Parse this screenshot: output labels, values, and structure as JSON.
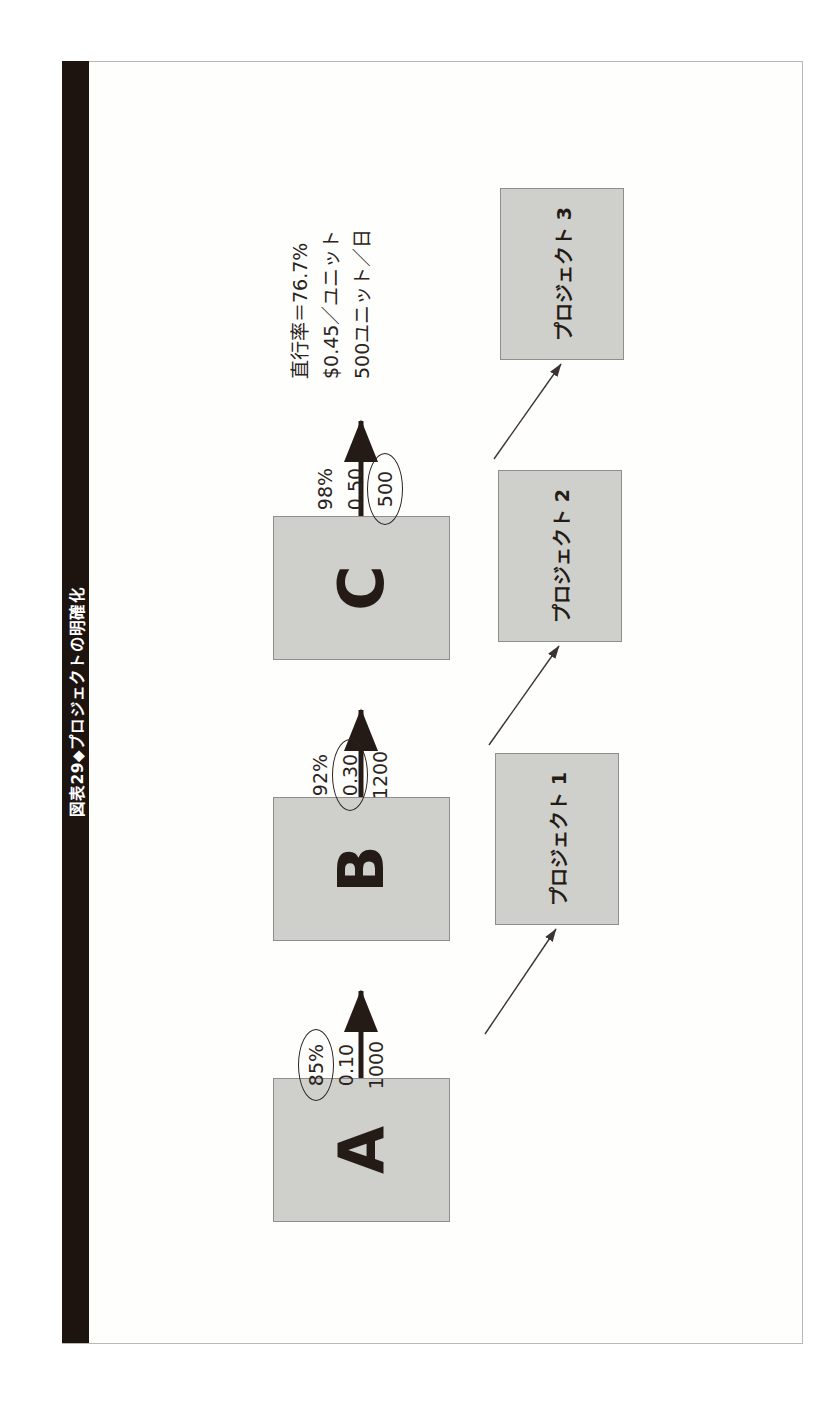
{
  "figure": {
    "title": "図表29◆プロジェクトの明確化"
  },
  "row_labels": [
    {
      "label": "直行率"
    },
    {
      "label": "廃棄"
    },
    {
      "label": "能力"
    }
  ],
  "process_steps": [
    {
      "name": "step-a",
      "label": "A",
      "metrics": {
        "yield": "85%",
        "scrap": "0.10",
        "capacity": "1000",
        "highlighted": "yield"
      },
      "project": {
        "label": "プロジェクト 1"
      }
    },
    {
      "name": "step-b",
      "label": "B",
      "metrics": {
        "yield": "92%",
        "scrap": "0.30",
        "capacity": "1200",
        "highlighted": "scrap"
      },
      "project": {
        "label": "プロジェクト 2"
      }
    },
    {
      "name": "step-c",
      "label": "C",
      "metrics": {
        "yield": "98%",
        "scrap": "0.50",
        "capacity": "500",
        "highlighted": "capacity"
      },
      "project": {
        "label": "プロジェクト 3"
      }
    }
  ],
  "summary": {
    "lines": [
      "直行率＝76.7%",
      "$0.45／ユニット",
      "500ユニット／日"
    ]
  },
  "colors": {
    "box_fill": "#cfd0cb",
    "box_stroke": "#8e8f8a",
    "ink": "#241a16",
    "title_bar": "#1d1410",
    "frame": "#b9b9b4",
    "page": "#ffffff"
  }
}
